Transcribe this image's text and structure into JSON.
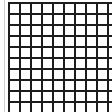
{
  "grid": {
    "line_color": "#1c1c1c",
    "background": "#ffffff",
    "faint_line_color": "#cfcfcf",
    "cell_size": 11,
    "columns": 10,
    "rows": 10,
    "origin_x": 8,
    "origin_y": 2
  }
}
